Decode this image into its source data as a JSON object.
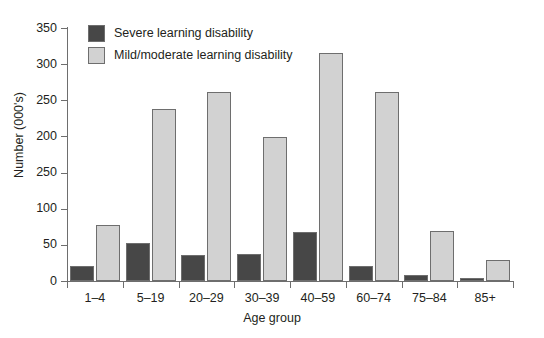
{
  "chart_data": {
    "type": "bar",
    "title": "",
    "xlabel": "Age group",
    "ylabel": "Number (000's)",
    "categories": [
      "1–4",
      "5–19",
      "20–29",
      "30–39",
      "40–59",
      "60–74",
      "75–84",
      "85+"
    ],
    "series": [
      {
        "name": "Severe learning disability",
        "color": "#474747",
        "values": [
          21,
          52,
          36,
          38,
          68,
          21,
          9,
          4
        ]
      },
      {
        "name": "Mild/moderate learning disability",
        "color": "#d2d2d2",
        "values": [
          77,
          238,
          262,
          199,
          315,
          262,
          69,
          29
        ]
      }
    ],
    "ylim": [
      0,
      350
    ],
    "ytick_values": [
      0,
      50,
      100,
      150,
      200,
      250,
      300,
      350
    ],
    "ytick_labels": [
      "0",
      "50",
      "100",
      "250",
      "200",
      "250",
      "300",
      "350"
    ],
    "grid": false,
    "legend_position": "top-left"
  },
  "legend": {
    "items": [
      {
        "label": "Severe learning disability",
        "swatch": "severe"
      },
      {
        "label": "Mild/moderate learning disability",
        "swatch": "mild"
      }
    ]
  }
}
